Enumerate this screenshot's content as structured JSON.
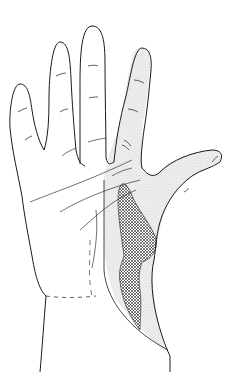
{
  "figure": {
    "regions": [
      {
        "name": "stippled-region",
        "description": "Radial side of palm, index finger and thumb",
        "fill": "stippled"
      },
      {
        "name": "crosshatched-region",
        "description": "Thenar area",
        "fill": "crosshatch"
      }
    ],
    "colors": {
      "outline": "#1a1a1a",
      "stipple": "#e6e6e6",
      "hatch": "#333333",
      "background": "#ffffff"
    }
  }
}
